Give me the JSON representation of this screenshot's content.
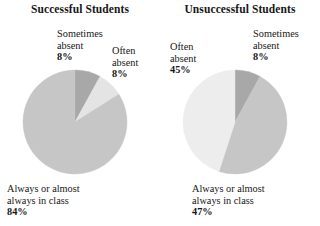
{
  "chart_data": [
    {
      "type": "pie",
      "title": "Successful Students",
      "categories": [
        "Sometimes absent",
        "Often absent",
        "Always or almost always in class"
      ],
      "values": [
        8,
        84,
        8
      ],
      "labels": [
        "8%",
        "8%",
        "84%"
      ],
      "units": "percent",
      "legend": "none",
      "grid": false,
      "slices": [
        {
          "name": "Sometimes absent",
          "value": 8,
          "label": "8%",
          "color": "#a8a8a8",
          "start_deg": 0,
          "end_deg": 28.8
        },
        {
          "name": "Often absent",
          "value": 8,
          "label": "8%",
          "color": "#e4e4e4",
          "start_deg": 28.8,
          "end_deg": 57.6
        },
        {
          "name": "Always or almost always in class",
          "value": 84,
          "label": "84%",
          "color": "#c6c6c6",
          "start_deg": 57.6,
          "end_deg": 360
        }
      ]
    },
    {
      "type": "pie",
      "title": "Unsuccessful Students",
      "categories": [
        "Sometimes absent",
        "Always or almost always in class",
        "Often absent"
      ],
      "values": [
        8,
        47,
        45
      ],
      "labels": [
        "8%",
        "47%",
        "45%"
      ],
      "units": "percent",
      "legend": "none",
      "grid": false,
      "slices": [
        {
          "name": "Sometimes absent",
          "value": 8,
          "label": "8%",
          "color": "#a8a8a8",
          "start_deg": 0,
          "end_deg": 28.8
        },
        {
          "name": "Always or almost always in class",
          "value": 47,
          "label": "47%",
          "color": "#c6c6c6",
          "start_deg": 28.8,
          "end_deg": 198.0
        },
        {
          "name": "Often absent",
          "value": 45,
          "label": "45%",
          "color": "#ededed",
          "start_deg": 198.0,
          "end_deg": 360
        }
      ]
    }
  ],
  "successful": {
    "title": "Successful Students",
    "labels": {
      "sometimes_line1": "Sometimes",
      "sometimes_line2": "absent",
      "sometimes_pct": "8%",
      "often_line1": "Often",
      "often_line2": "absent",
      "often_pct": "8%",
      "always_line1": "Always or almost",
      "always_line2": "always in class",
      "always_pct": "84%"
    }
  },
  "unsuccessful": {
    "title": "Unsuccessful Students",
    "labels": {
      "often_line1": "Often",
      "often_line2": "absent",
      "often_pct": "45%",
      "sometimes_line1": "Sometimes",
      "sometimes_line2": "absent",
      "sometimes_pct": "8%",
      "always_line1": "Always or almost",
      "always_line2": "always in class",
      "always_pct": "47%"
    }
  },
  "colors": {
    "slice_dark": "#a8a8a8",
    "slice_medium": "#c6c6c6",
    "slice_light": "#e4e4e4",
    "slice_lightest": "#ededed",
    "text": "#161616",
    "background": "#ffffff"
  }
}
